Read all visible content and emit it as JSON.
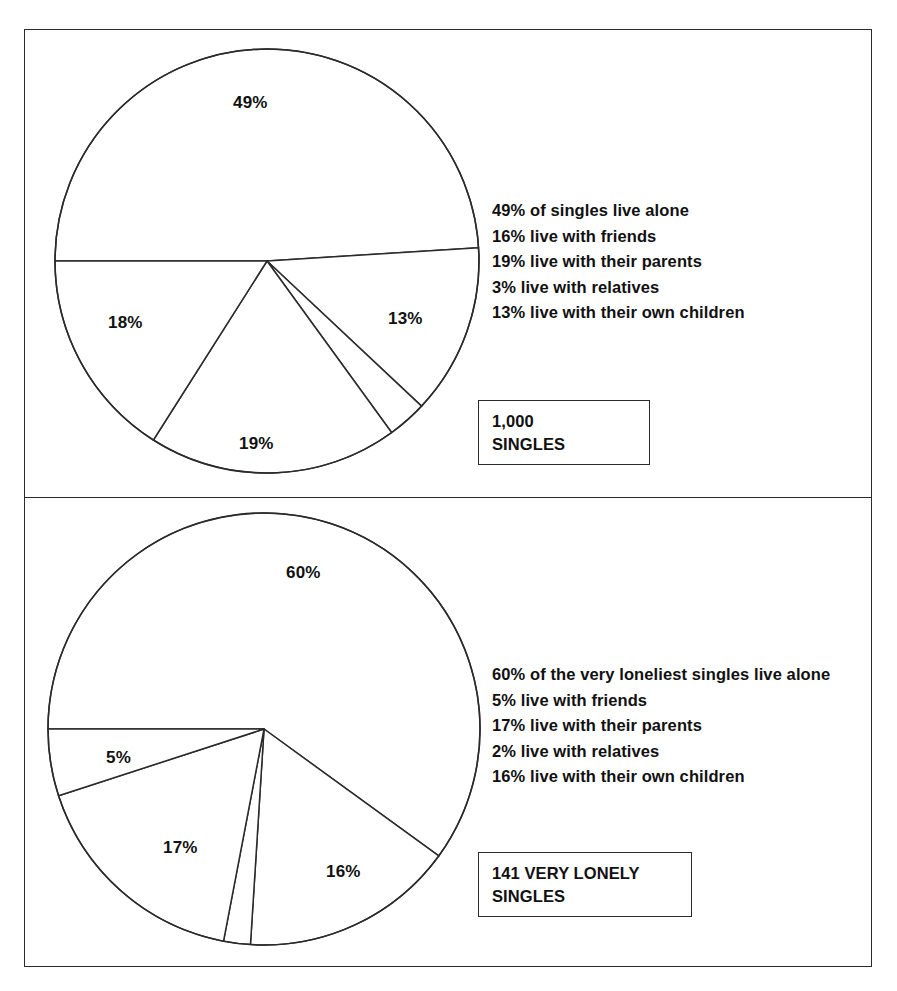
{
  "figure": {
    "panels": [
      {
        "id": "singles-all",
        "caption": {
          "line1": "1,000",
          "line2": "SINGLES"
        },
        "legend": [
          "49% of singles live alone",
          "16% live with friends",
          "19% live with their parents",
          "3% live with relatives",
          "13% live with their own children"
        ],
        "pie_labels": [
          {
            "text": "49%",
            "x": 233,
            "y": 93
          },
          {
            "text": "13%",
            "x": 388,
            "y": 309
          },
          {
            "text": "19%",
            "x": 239,
            "y": 434
          },
          {
            "text": "18%",
            "x": 108,
            "y": 313
          }
        ]
      },
      {
        "id": "singles-very-lonely",
        "caption": {
          "line1": "141 VERY LONELY",
          "line2": "SINGLES"
        },
        "legend": [
          "60% of the very loneliest singles live alone",
          "5% live with friends",
          "17% live with their parents",
          "2% live with relatives",
          "16% live with their own children"
        ],
        "pie_labels": [
          {
            "text": "60%",
            "x": 286,
            "y": 563
          },
          {
            "text": "5%",
            "x": 106,
            "y": 748
          },
          {
            "text": "17%",
            "x": 163,
            "y": 838
          },
          {
            "text": "16%",
            "x": 326,
            "y": 862
          }
        ]
      }
    ]
  },
  "chart_data": [
    {
      "type": "pie",
      "title": "1,000 SINGLES",
      "total_label": "1,000",
      "total_unit": "SINGLES",
      "categories": [
        "live alone",
        "live with their own children",
        "live with relatives",
        "live with their parents",
        "live with friends"
      ],
      "values": [
        49,
        13,
        3,
        19,
        16
      ],
      "value_labels_on_pie": [
        "49%",
        "13%",
        "19%",
        "18%"
      ],
      "legend_entries": [
        "49% of singles live alone",
        "16% live with friends",
        "19% live with their parents",
        "3% live with relatives",
        "13% live with their own children"
      ],
      "legend_position": "right",
      "start_angle_deg": 180,
      "direction": "clockwise",
      "grid": false,
      "colors": {
        "slice_fill": "#ffffff",
        "slice_stroke": "#2b2b2b"
      }
    },
    {
      "type": "pie",
      "title": "141 VERY LONELY SINGLES",
      "total_label": "141 VERY LONELY",
      "total_unit": "SINGLES",
      "categories": [
        "live alone",
        "live with their own children",
        "live with relatives",
        "live with their parents",
        "live with friends"
      ],
      "values": [
        60,
        16,
        2,
        17,
        5
      ],
      "value_labels_on_pie": [
        "60%",
        "16%",
        "17%",
        "5%"
      ],
      "legend_entries": [
        "60% of the very loneliest singles live alone",
        "5% live with friends",
        "17% live with their parents",
        "2% live with relatives",
        "16% live with their own children"
      ],
      "legend_position": "right",
      "start_angle_deg": 180,
      "direction": "clockwise",
      "grid": false,
      "colors": {
        "slice_fill": "#ffffff",
        "slice_stroke": "#2b2b2b"
      }
    }
  ],
  "geometry": {
    "pies": [
      {
        "cx": 227,
        "cy": 226,
        "r": 212,
        "size": 460
      },
      {
        "cx": 224,
        "cy": 226,
        "r": 216,
        "size": 460
      }
    ]
  }
}
